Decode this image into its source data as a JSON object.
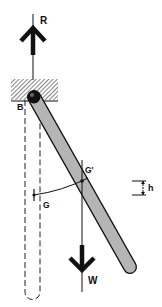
{
  "diagram": {
    "labels": {
      "reaction": "R",
      "pivot": "B",
      "cog_rest": "G",
      "cog_displaced": "G'",
      "weight": "W",
      "height_rise": "h"
    },
    "colors": {
      "ink": "#111111",
      "bar_fill": "#b5b5b5",
      "hatch": "#333333",
      "background": "#ffffff"
    }
  }
}
